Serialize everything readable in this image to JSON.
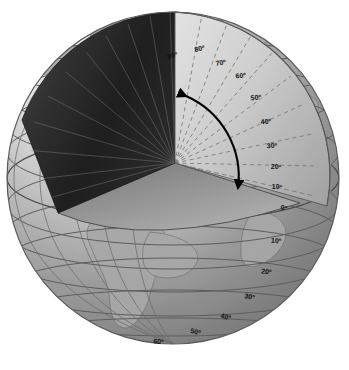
{
  "figure": {
    "type": "cutaway-sphere-diagram",
    "background_color": "#ffffff"
  },
  "globe": {
    "center_x": 173,
    "center_y": 178,
    "radius": 166,
    "surface_light_color": "#e9e9e9",
    "surface_mid_color": "#9a9a9a",
    "surface_dark_color": "#6f6f6f",
    "outline_color": "#5a5a5a",
    "land_color": "#a9a9a9",
    "land_outline_color": "#6a6a6a",
    "continents_visible": [
      "North America",
      "South America",
      "Europe",
      "Africa",
      "Greenland"
    ]
  },
  "cutaway": {
    "left_face_color": "#242424",
    "left_face_color_edge": "#5c5c5c",
    "plane_face_color": "#8d8d8d",
    "plane_face_color_light": "#b5b5b5",
    "right_face_color": "#d2d2d2",
    "right_face_color_dark": "#9e9e9e",
    "apex_x": 175,
    "apex_y": 163,
    "radial_line_color": "#6d6d6d",
    "radial_dash_color": "#707070",
    "radial_interval_degrees": 10
  },
  "axis": {
    "polar_axis_color": "#333333",
    "equator_line_color": "#4a4a4a"
  },
  "arrow": {
    "name": "latitude-angle-arrow",
    "color": "#000000",
    "double_headed": true,
    "from_label": "90",
    "to_label": "0",
    "description": "curved double-headed arrow sweeping from pole to equator"
  },
  "labels": {
    "northern": [
      {
        "text": "90º",
        "x": 173,
        "y": 58,
        "angle": 90
      },
      {
        "text": "80º",
        "x": 200,
        "y": 51,
        "angle": 80
      },
      {
        "text": "70º",
        "x": 221,
        "y": 65,
        "angle": 70
      },
      {
        "text": "60º",
        "x": 241,
        "y": 78,
        "angle": 60
      },
      {
        "text": "50º",
        "x": 256,
        "y": 99,
        "angle": 50
      },
      {
        "text": "40º",
        "x": 266,
        "y": 123,
        "angle": 40
      },
      {
        "text": "30º",
        "x": 272,
        "y": 147,
        "angle": 30
      },
      {
        "text": "20º",
        "x": 275,
        "y": 168,
        "angle": 20
      },
      {
        "text": "10º",
        "x": 276,
        "y": 188,
        "angle": 10
      }
    ],
    "equator": {
      "text": "0º",
      "x": 283,
      "y": 209,
      "angle": 0
    },
    "southern": [
      {
        "text": "10º",
        "x": 275,
        "y": 242,
        "angle": -10
      },
      {
        "text": "20º",
        "x": 265,
        "y": 273,
        "angle": -20
      },
      {
        "text": "30º",
        "x": 248,
        "y": 298,
        "angle": -30
      },
      {
        "text": "40º",
        "x": 224,
        "y": 318,
        "angle": -40
      },
      {
        "text": "50º",
        "x": 194,
        "y": 333,
        "angle": -50
      },
      {
        "text": "60º",
        "x": 157,
        "y": 343,
        "angle": -60
      }
    ]
  },
  "parallels": {
    "description": "latitude circles drawn on the visible sphere surface at 10 degree intervals",
    "interval_degrees": 10,
    "color": "#5e5e5e"
  },
  "meridians": {
    "description": "longitude lines visible on the left limb of the sphere",
    "color": "#6a6a6a"
  }
}
